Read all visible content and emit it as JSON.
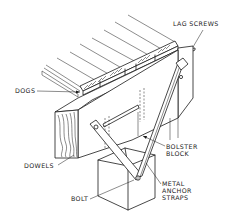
{
  "diagram": {
    "type": "isometric technical line drawing",
    "colors": {
      "line": "#1a1a1a",
      "background": "#ffffff"
    },
    "labels": {
      "lag_screws": "LAG SCREWS",
      "dogs": "DOGS",
      "dowels": "DOWELS",
      "bolster_block_line1": "BOLSTER",
      "bolster_block_line2": "BLOCK",
      "bolt": "BOLT",
      "metal_anchor_straps_line1": "METAL",
      "metal_anchor_straps_line2": "ANCHOR",
      "metal_anchor_straps_line3": "STRAPS"
    }
  }
}
